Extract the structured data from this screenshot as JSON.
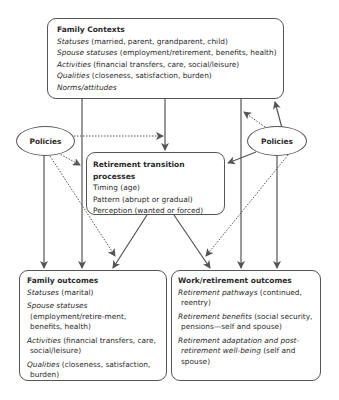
{
  "diagram": {
    "family_contexts": {
      "title": "Family Contexts",
      "items": [
        {
          "term": "Statuses",
          "detail": " (married, parent, grandparent, child)"
        },
        {
          "term": "Spouse statuses",
          "detail": " (employment/retirement, benefits, health)"
        },
        {
          "term": "Activities",
          "detail": " (financial transfers, care, social/leisure)"
        },
        {
          "term": "Qualities",
          "detail": " (closeness, satisfaction, burden)"
        },
        {
          "term": "Norms/attitudes",
          "detail": ""
        }
      ]
    },
    "policies_left": {
      "label": "Policies"
    },
    "policies_right": {
      "label": "Policies"
    },
    "retirement_transition": {
      "title": "Retirement transition processes",
      "items": [
        "Timing (age)",
        "Pattern (abrupt or gradual)",
        "Perception (wanted or forced)"
      ]
    },
    "family_outcomes": {
      "title": "Family outcomes",
      "items": [
        {
          "term": "Statuses",
          "detail": " (marital)"
        },
        {
          "term": "Spouse statuses",
          "detail": " (employment/retire-ment, benefits, health)"
        },
        {
          "term": "Activities",
          "detail": " (financial transfers, care, social/leisure)"
        },
        {
          "term": "Qualities",
          "detail": " (closeness, satisfaction, burden)"
        }
      ]
    },
    "work_retirement_outcomes": {
      "title": "Work/retirement outcomes",
      "items": [
        {
          "term": "Retirement pathways",
          "detail": " (continued, reentry)"
        },
        {
          "term": "Retirement benefits",
          "detail": " (social security, pensions—self and spouse)"
        },
        {
          "term": "Retirement adaptation and post-retirement well-being",
          "detail": " (self and spouse)"
        }
      ]
    },
    "colors": {
      "stroke": "#555555",
      "text": "#2a2a2a",
      "background": "#ffffff"
    }
  }
}
